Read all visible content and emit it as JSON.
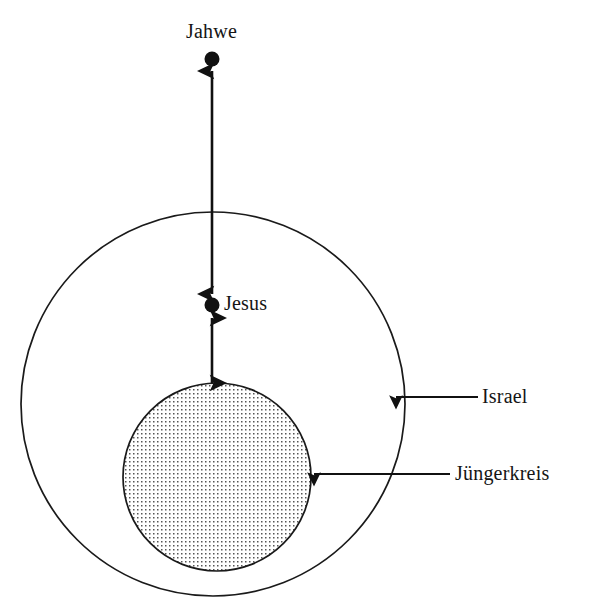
{
  "diagram": {
    "background_color": "#ffffff",
    "stroke_color": "#1a1a1a",
    "nodes": {
      "jahwe": {
        "label": "Jahwe",
        "shape": "filled-dot",
        "cx": 212,
        "cy": 59,
        "r": 7,
        "fill": "#111111"
      },
      "jesus": {
        "label": "Jesus",
        "shape": "filled-dot",
        "cx": 212,
        "cy": 305,
        "r": 7,
        "fill": "#111111"
      }
    },
    "regions": {
      "israel": {
        "label": "Israel",
        "shape": "circle",
        "cx": 213,
        "cy": 404,
        "r": 192,
        "fill": "none",
        "stroke": "#1a1a1a",
        "stroke_width": 1.6
      },
      "juengerkreis": {
        "label": "Jüngerkreis",
        "shape": "circle",
        "cx": 217,
        "cy": 477,
        "r": 94,
        "fill": "dotted-pattern",
        "stroke": "#1a1a1a",
        "stroke_width": 1.6,
        "dot_color": "#5a5a5a",
        "dot_spacing": 4
      }
    },
    "connectors": [
      {
        "name": "jahwe-jesus",
        "from": "jesus",
        "to": "jahwe",
        "style": "double-headed-arrow",
        "orientation": "vertical",
        "x": 212,
        "y_top": 70,
        "y_bottom": 293
      },
      {
        "name": "jesus-juengerkreis",
        "from": "jesus",
        "to": "juengerkreis",
        "style": "double-headed-arrow",
        "orientation": "vertical",
        "x": 212,
        "y_top": 317,
        "y_bottom": 382
      },
      {
        "name": "israel-pointer",
        "style": "single-headed-arrow",
        "orientation": "horizontal-left",
        "y": 397,
        "x_start": 478,
        "x_end": 393
      },
      {
        "name": "juengerkreis-pointer",
        "style": "single-headed-arrow",
        "orientation": "horizontal-left",
        "y": 474,
        "x_start": 450,
        "x_end": 311
      }
    ]
  }
}
